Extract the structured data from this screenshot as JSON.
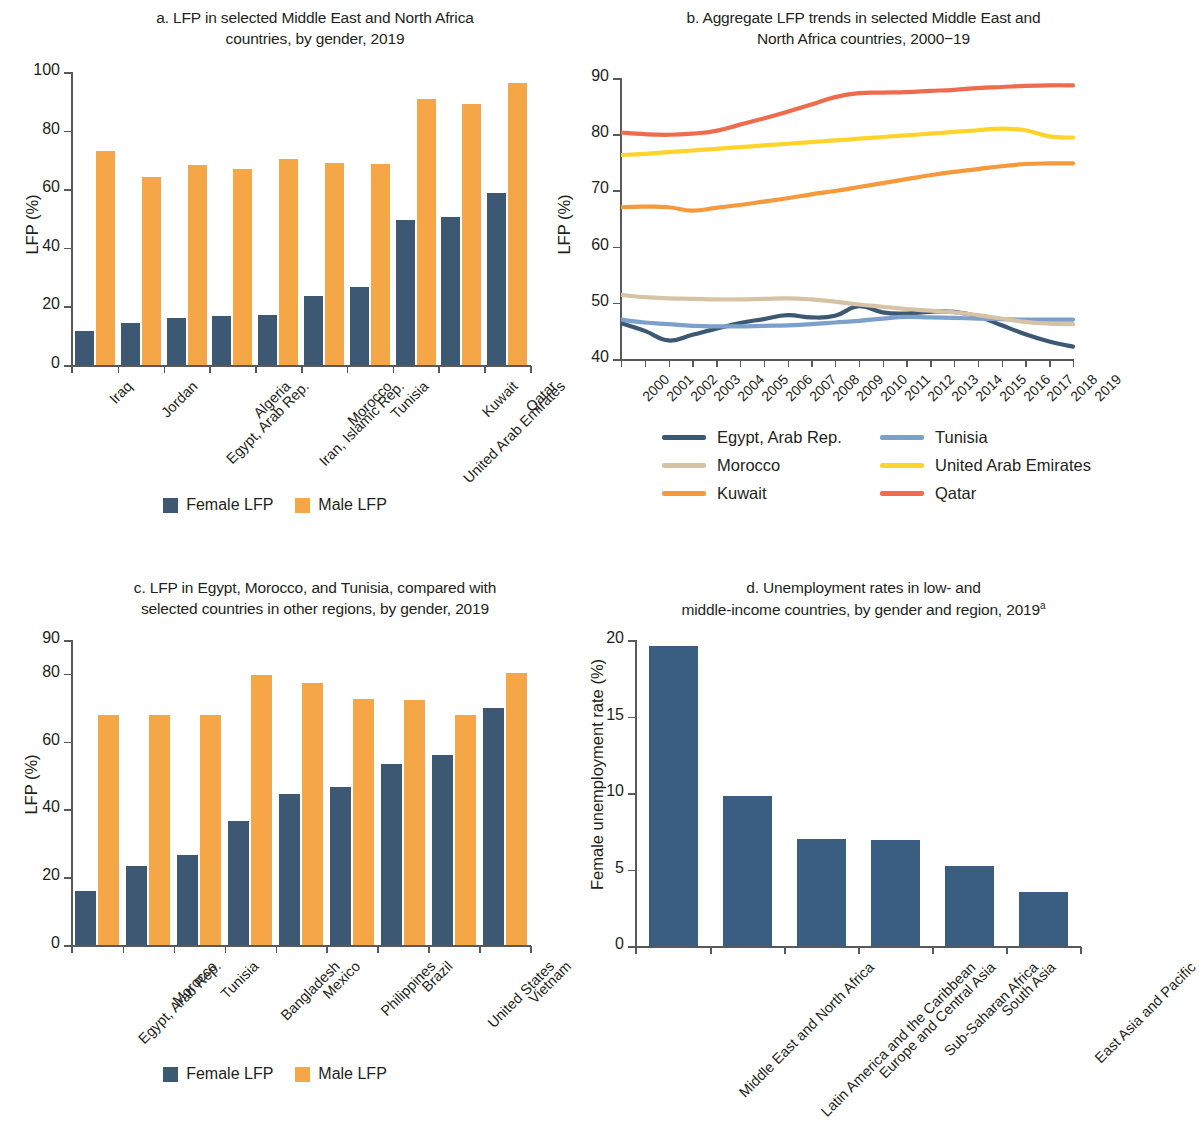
{
  "colors": {
    "female_bar": "#3d5872",
    "male_bar": "#f5a748",
    "unemployment_bar": "#3a5e82",
    "axis": "#58595b",
    "egypt": "#3d5872",
    "tunisia": "#7ba0cc",
    "morocco": "#d6c3a6",
    "uae": "#ffd42a",
    "kuwait": "#f49a3c",
    "qatar": "#ee6b4d"
  },
  "panel_a": {
    "title_line1": "a. LFP in selected Middle East and North Africa",
    "title_line2": "countries, by gender, 2019",
    "legend": [
      {
        "label": "Female LFP",
        "color": "#3d5872"
      },
      {
        "label": "Male LFP",
        "color": "#f5a748"
      }
    ],
    "chart_data": {
      "type": "bar",
      "title": "a. LFP in selected Middle East and North Africa countries, by gender, 2019",
      "xlabel": "",
      "ylabel": "LFP (%)",
      "ylim": [
        0,
        100
      ],
      "yticks": [
        0,
        20,
        40,
        60,
        80,
        100
      ],
      "grid": false,
      "legend_position": "bottom-center",
      "categories": [
        "Iraq",
        "Jordan",
        "Egypt, Arab Rep.",
        "Algeria",
        "Iran, Islamic Rep.",
        "Morocco",
        "Tunisia",
        "United Arab Emirates",
        "Kuwait",
        "Qatar"
      ],
      "series": [
        {
          "name": "Female LFP",
          "color": "#3d5872",
          "values": [
            11.7,
            14.4,
            16.0,
            16.7,
            17.2,
            23.4,
            26.5,
            49.4,
            50.6,
            58.6
          ]
        },
        {
          "name": "Male LFP",
          "color": "#f5a748",
          "values": [
            72.9,
            64.3,
            68.4,
            66.8,
            70.2,
            69.0,
            68.5,
            90.7,
            89.1,
            96.4
          ]
        }
      ]
    }
  },
  "panel_b": {
    "title_line1": "b. Aggregate LFP trends in selected Middle East and",
    "title_line2": "North Africa countries, 2000−19",
    "chart_data": {
      "type": "line",
      "title": "b. Aggregate LFP trends in selected Middle East and North Africa countries, 2000−19",
      "xlabel": "",
      "ylabel": "LFP (%)",
      "ylim": [
        40,
        90
      ],
      "yticks": [
        40,
        50,
        60,
        70,
        80,
        90
      ],
      "grid": false,
      "legend_position": "bottom",
      "x": [
        2000,
        2001,
        2002,
        2003,
        2004,
        2005,
        2006,
        2007,
        2008,
        2009,
        2010,
        2011,
        2012,
        2013,
        2014,
        2015,
        2016,
        2017,
        2018,
        2019
      ],
      "series": [
        {
          "name": "Egypt, Arab Rep.",
          "color": "#3d5872",
          "values": [
            46.4,
            45.0,
            43.3,
            44.3,
            45.4,
            46.4,
            47.1,
            47.8,
            47.4,
            47.7,
            49.4,
            48.3,
            48.1,
            48.4,
            48.4,
            47.6,
            46.0,
            44.4,
            43.1,
            42.2
          ]
        },
        {
          "name": "Tunisia",
          "color": "#7ba0cc",
          "values": [
            47.0,
            46.5,
            46.2,
            45.9,
            45.8,
            45.8,
            45.9,
            46.0,
            46.2,
            46.5,
            46.8,
            47.2,
            47.5,
            47.4,
            47.3,
            47.2,
            47.1,
            47.0,
            47.0,
            47.0
          ]
        },
        {
          "name": "Morocco",
          "color": "#d6c3a6",
          "values": [
            51.4,
            51.0,
            50.8,
            50.7,
            50.6,
            50.6,
            50.7,
            50.8,
            50.6,
            50.2,
            49.7,
            49.3,
            48.9,
            48.6,
            48.3,
            47.8,
            47.2,
            46.6,
            46.3,
            46.2
          ]
        },
        {
          "name": "United Arab Emirates",
          "color": "#ffd42a",
          "values": [
            76.3,
            76.5,
            76.8,
            77.1,
            77.4,
            77.7,
            78.0,
            78.3,
            78.6,
            78.9,
            79.2,
            79.5,
            79.8,
            80.1,
            80.4,
            80.7,
            81.0,
            80.7,
            79.6,
            79.4
          ]
        },
        {
          "name": "Kuwait",
          "color": "#f49a3c",
          "values": [
            67.0,
            67.1,
            67.0,
            66.4,
            66.9,
            67.4,
            68.0,
            68.6,
            69.3,
            69.9,
            70.6,
            71.3,
            72.0,
            72.7,
            73.3,
            73.8,
            74.3,
            74.7,
            74.8,
            74.8
          ]
        },
        {
          "name": "Qatar",
          "color": "#ee6b4d",
          "values": [
            80.3,
            80.0,
            79.9,
            80.1,
            80.6,
            81.7,
            82.8,
            84.0,
            85.3,
            86.6,
            87.3,
            87.4,
            87.5,
            87.7,
            87.9,
            88.2,
            88.4,
            88.6,
            88.7,
            88.7
          ]
        }
      ]
    },
    "legend": [
      {
        "label": "Egypt, Arab Rep.",
        "color": "#3d5872"
      },
      {
        "label": "Tunisia",
        "color": "#7ba0cc"
      },
      {
        "label": "Morocco",
        "color": "#d6c3a6"
      },
      {
        "label": "United Arab Emirates",
        "color": "#ffd42a"
      },
      {
        "label": "Kuwait",
        "color": "#f49a3c"
      },
      {
        "label": "Qatar",
        "color": "#ee6b4d"
      }
    ]
  },
  "panel_c": {
    "title_line1": "c. LFP in Egypt, Morocco, and Tunisia, compared with",
    "title_line2": "selected countries in other regions, by gender, 2019",
    "legend": [
      {
        "label": "Female LFP",
        "color": "#3d5872"
      },
      {
        "label": "Male LFP",
        "color": "#f5a748"
      }
    ],
    "chart_data": {
      "type": "bar",
      "title": "c. LFP in Egypt, Morocco, and Tunisia, compared with selected countries in other regions, by gender, 2019",
      "xlabel": "",
      "ylabel": "LFP (%)",
      "ylim": [
        0,
        90
      ],
      "yticks": [
        0,
        20,
        40,
        60,
        80,
        90
      ],
      "grid": false,
      "legend_position": "bottom-center",
      "categories": [
        "Egypt, Arab Rep.",
        "Morocco",
        "Tunisia",
        "Bangladesh",
        "Mexico",
        "Philippines",
        "Brazil",
        "United States",
        "Vietnam"
      ],
      "series": [
        {
          "name": "Female LFP",
          "color": "#3d5872",
          "values": [
            16.0,
            23.4,
            26.5,
            36.6,
            44.5,
            46.5,
            53.3,
            56.2,
            70.0
          ]
        },
        {
          "name": "Male LFP",
          "color": "#f5a748",
          "values": [
            68.0,
            68.0,
            68.0,
            79.8,
            77.2,
            72.7,
            72.3,
            68.0,
            80.3
          ]
        }
      ]
    }
  },
  "panel_d": {
    "title_line1": "d. Unemployment rates in low- and",
    "title_line2": "middle-income countries, by gender and region, 2019",
    "title_sup": "a",
    "chart_data": {
      "type": "bar",
      "title": "d. Unemployment rates in low- and middle-income countries, by gender and region, 2019a",
      "xlabel": "",
      "ylabel": "Female unemployment rate (%)",
      "ylim": [
        0,
        20
      ],
      "yticks": [
        0,
        5,
        10,
        15,
        20
      ],
      "grid": false,
      "legend_position": "none",
      "categories": [
        "Middle East and North Africa",
        "Latin America and the Caribbean",
        "Europe and Central Asia",
        "Sub-Saharan Africa",
        "South Asia",
        "East Asia and Pacific"
      ],
      "values": [
        19.6,
        9.8,
        7.0,
        6.9,
        5.2,
        3.5
      ],
      "series": [
        {
          "name": "Female unemployment rate",
          "color": "#3a5e82",
          "values": [
            19.6,
            9.8,
            7.0,
            6.9,
            5.2,
            3.5
          ]
        }
      ]
    }
  }
}
